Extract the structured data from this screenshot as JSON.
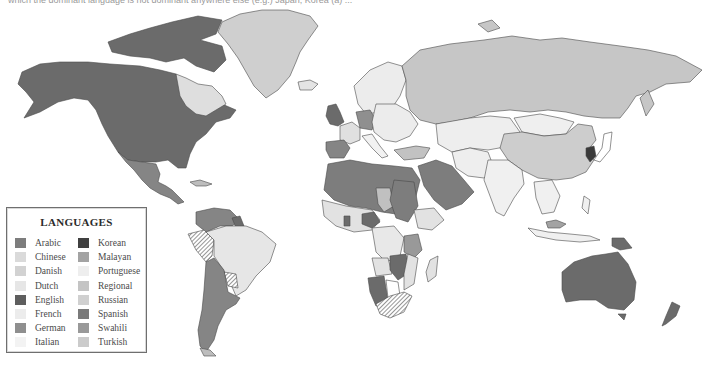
{
  "caption": "which the dominant language is not dominant anywhere else (e.g.) Japan, Korea (a) ...",
  "map": {
    "ocean_color": "#ffffff",
    "border_color": "#4a4a4a",
    "regions": {
      "north_america_english": "#6b6b6b",
      "quebec_french": "#dedede",
      "greenland_danish": "#cfcfcf",
      "mexico_central_spanish": "#858585",
      "south_america_spanish": "#858585",
      "brazil_portuguese": "#e6e6e6",
      "russia": "#c6c6c6",
      "china": "#cdcdcd",
      "korea": "#3a3a3a",
      "australia_english": "#6b6b6b",
      "new_zealand_english": "#6b6b6b",
      "png_english": "#6b6b6b",
      "uk_english": "#6b6b6b",
      "germany": "#8f8f8f",
      "france": "#e0e0e0",
      "iberia_spanish": "#858585",
      "italy": "#f2f2f2",
      "turkey": "#c2c2c2",
      "north_africa_arabic": "#7d7d7d",
      "arabia_arabic": "#7d7d7d",
      "sub_saharan_french": "#e2e2e2",
      "swahili": "#999999",
      "regional_hatched": "#b8b8b8",
      "madagascar": "#e2e2e2",
      "europe_other": "#ececec",
      "central_asia": "#eeeeee",
      "south_asia": "#f0f0f0",
      "southeast_asia": "#f0f0f0",
      "malayan": "#a3a3a3",
      "namibia_english": "#6b6b6b",
      "nigeria_english": "#6b6b6b"
    }
  },
  "legend": {
    "title": "LANGUAGES",
    "items": [
      {
        "label": "Arabic",
        "color": "#7d7d7d"
      },
      {
        "label": "Chinese",
        "color": "#dadada"
      },
      {
        "label": "Danish",
        "color": "#d2d2d2"
      },
      {
        "label": "Dutch",
        "color": "#e6e6e6"
      },
      {
        "label": "English",
        "color": "#5e5e5e"
      },
      {
        "label": "French",
        "color": "#ececec"
      },
      {
        "label": "German",
        "color": "#8f8f8f"
      },
      {
        "label": "Italian",
        "color": "#f3f3f3"
      },
      {
        "label": "Korean",
        "color": "#404040"
      },
      {
        "label": "Malayan",
        "color": "#a3a3a3"
      },
      {
        "label": "Portuguese",
        "color": "#eeeeee"
      },
      {
        "label": "Regional",
        "color": "#c4c4c4"
      },
      {
        "label": "Russian",
        "color": "#d0d0d0"
      },
      {
        "label": "Spanish",
        "color": "#7a7a7a"
      },
      {
        "label": "Swahili",
        "color": "#999999"
      },
      {
        "label": "Turkish",
        "color": "#cbcbcb"
      }
    ]
  }
}
